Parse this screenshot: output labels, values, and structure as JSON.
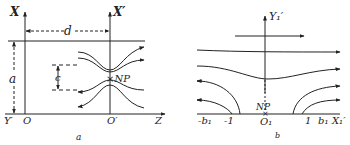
{
  "panel_a": {
    "caption": "a",
    "axis_x": "X",
    "axis_x_prime": "X′",
    "axis_y_prime": "Y′",
    "axis_z": "Z",
    "origin": "O",
    "origin_prime": "O′",
    "dim_d": "d",
    "dim_a": "a",
    "dim_c": "c",
    "neutral_point": "×NP"
  },
  "panel_b": {
    "caption": "b",
    "axis_y": "Y₁′",
    "axis_x": "X₁′",
    "origin": "O₁",
    "neutral_point": "NP",
    "tick_neg_b": "-b₁",
    "tick_neg_1": "-1",
    "tick_pos_1": "1",
    "tick_pos_b": "b₁"
  },
  "colors": {
    "ink": "#222222",
    "background": "#ffffff"
  }
}
